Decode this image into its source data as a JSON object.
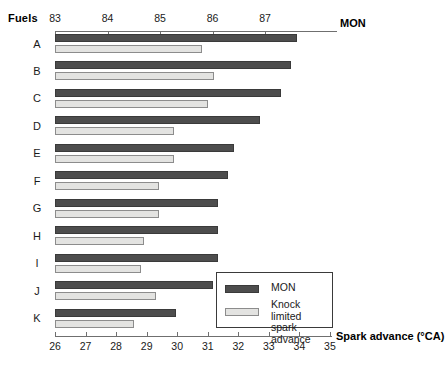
{
  "labels": {
    "fuels_title": "Fuels",
    "mon_axis": "MON",
    "spark_axis": "Spark advance (°CA)"
  },
  "legend": {
    "mon_label": "MON",
    "knock_label": "Knock limited\nspark advance"
  },
  "chart_data": {
    "type": "bar",
    "orientation": "horizontal",
    "title": "",
    "categories": [
      "A",
      "B",
      "C",
      "D",
      "E",
      "F",
      "G",
      "H",
      "I",
      "J",
      "K"
    ],
    "category_axis_label": "Fuels",
    "grid": false,
    "legend_position": "inside-bottom-right",
    "axes": [
      {
        "name": "MON",
        "position": "top",
        "label": "MON",
        "ticks": [
          83,
          84,
          85,
          86,
          87
        ],
        "tick_labels": [
          "83",
          "84",
          "85",
          "86",
          "87"
        ],
        "range": [
          82.6,
          88.4
        ]
      },
      {
        "name": "Spark advance",
        "position": "bottom",
        "label": "Spark advance (°CA)",
        "ticks": [
          26,
          27,
          28,
          29,
          30,
          31,
          32,
          33,
          34,
          35
        ],
        "tick_labels": [
          "26",
          "27",
          "28",
          "29",
          "30",
          "31",
          "32",
          "33",
          "34",
          "35"
        ],
        "range": [
          26,
          35.1
        ]
      }
    ],
    "series": [
      {
        "name": "MON",
        "axis": "MON",
        "color": "#4d4d4d",
        "values": [
          87.6,
          87.5,
          87.3,
          86.9,
          86.4,
          86.3,
          86.1,
          86.1,
          86.1,
          86.0,
          85.3
        ]
      },
      {
        "name": "Knock limited spark advance",
        "axis": "Spark advance",
        "color": "#e3e3e1",
        "values": [
          30.8,
          31.2,
          31.0,
          29.9,
          29.9,
          29.4,
          29.4,
          28.9,
          28.8,
          29.3,
          28.6
        ]
      }
    ]
  }
}
